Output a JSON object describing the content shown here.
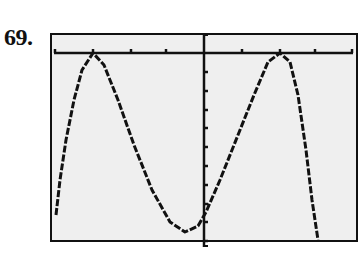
{
  "problem": {
    "number": "69."
  },
  "chart_data": {
    "type": "line",
    "title": "",
    "xlabel": "",
    "ylabel": "",
    "grid": false,
    "legend": null,
    "x_ticks_each_side": 4,
    "y_ticks_below_axis": 10,
    "points": [
      {
        "x": 56,
        "y": 215
      },
      {
        "x": 60,
        "y": 180
      },
      {
        "x": 66,
        "y": 140
      },
      {
        "x": 74,
        "y": 100
      },
      {
        "x": 82,
        "y": 70
      },
      {
        "x": 93,
        "y": 53
      },
      {
        "x": 104,
        "y": 65
      },
      {
        "x": 118,
        "y": 100
      },
      {
        "x": 134,
        "y": 145
      },
      {
        "x": 152,
        "y": 190
      },
      {
        "x": 170,
        "y": 222
      },
      {
        "x": 185,
        "y": 232
      },
      {
        "x": 198,
        "y": 226
      },
      {
        "x": 206,
        "y": 212
      },
      {
        "x": 220,
        "y": 180
      },
      {
        "x": 238,
        "y": 135
      },
      {
        "x": 254,
        "y": 95
      },
      {
        "x": 268,
        "y": 62
      },
      {
        "x": 280,
        "y": 53
      },
      {
        "x": 290,
        "y": 62
      },
      {
        "x": 298,
        "y": 95
      },
      {
        "x": 306,
        "y": 150
      },
      {
        "x": 312,
        "y": 200
      },
      {
        "x": 318,
        "y": 240
      }
    ],
    "axes": {
      "x_axis_y": 53,
      "y_axis_x": 204,
      "x_tick_positions": [
        55,
        93,
        131,
        166,
        242,
        280,
        315,
        352
      ],
      "y_tick_positions": [
        72,
        91,
        110,
        128,
        147,
        166,
        185,
        204,
        222,
        241
      ]
    },
    "colors": {
      "screen": "#efefef",
      "ink": "#111111"
    }
  }
}
